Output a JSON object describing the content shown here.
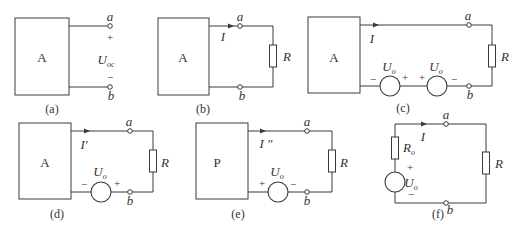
{
  "figure": {
    "panels": [
      {
        "id": "a",
        "caption": "(a)",
        "network_label": "A",
        "terminals": [
          "a",
          "b"
        ],
        "voltage": {
          "symbol": "U",
          "subscript": "oc",
          "plus": "+",
          "minus": "−"
        }
      },
      {
        "id": "b",
        "caption": "(b)",
        "network_label": "A",
        "terminals": [
          "a",
          "b"
        ],
        "current": "I",
        "load": "R"
      },
      {
        "id": "c",
        "caption": "(c)",
        "network_label": "A",
        "terminals": [
          "a",
          "b"
        ],
        "current": "I",
        "load": "R",
        "sources": [
          {
            "symbol": "U",
            "subscript": "o",
            "left_sign": "−",
            "right_sign": "+"
          },
          {
            "symbol": "U",
            "subscript": "o",
            "left_sign": "+",
            "right_sign": "−"
          }
        ]
      },
      {
        "id": "d",
        "caption": "(d)",
        "network_label": "A",
        "terminals": [
          "a",
          "b"
        ],
        "current": "I′",
        "load": "R",
        "sources": [
          {
            "symbol": "U",
            "subscript": "o",
            "left_sign": "−",
            "right_sign": "+"
          }
        ]
      },
      {
        "id": "e",
        "caption": "(e)",
        "network_label": "P",
        "terminals": [
          "a",
          "b"
        ],
        "current": "I ″",
        "load": "R",
        "sources": [
          {
            "symbol": "U",
            "subscript": "o",
            "left_sign": "+",
            "right_sign": "−"
          }
        ]
      },
      {
        "id": "f",
        "caption": "(f)",
        "terminals": [
          "a",
          "b"
        ],
        "current": "I",
        "load": "R",
        "internal_resistance": {
          "symbol": "R",
          "subscript": "o"
        },
        "sources": [
          {
            "symbol": "U",
            "subscript": "o",
            "top_sign": "+",
            "bottom_sign": "−"
          }
        ]
      }
    ]
  }
}
